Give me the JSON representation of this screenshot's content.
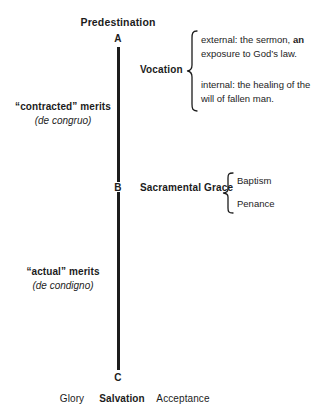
{
  "diagram": {
    "title": "Predestination",
    "background_color": "#ffffff",
    "ink_color": "#1c1c1c",
    "axis": {
      "name": "vertical-timeline",
      "upper_segment_label": "A to B",
      "lower_segment_label": "B to C"
    },
    "nodes": [
      {
        "id": "node-a",
        "letter": "A"
      },
      {
        "id": "node-b",
        "letter": "B"
      },
      {
        "id": "node-c",
        "letter": "C"
      }
    ],
    "left_annotations": [
      {
        "id": "contracted-merits",
        "line1": "“contracted” merits",
        "line2": "(de congruo)"
      },
      {
        "id": "actual-merits",
        "line1": "“actual” merits",
        "line2": "(de condigno)"
      }
    ],
    "branches": [
      {
        "id": "vocation",
        "label": "Vocation",
        "items": [
          {
            "id": "vocation-external",
            "prefix": "external: the sermon, ",
            "emphasis": "an",
            "suffix": " exposure to God’s law."
          },
          {
            "id": "vocation-internal",
            "prefix": "internal: the healing of the will of fallen man.",
            "emphasis": "",
            "suffix": ""
          }
        ]
      },
      {
        "id": "sacramental-grace",
        "label": "Sacramental Grace",
        "items": [
          {
            "id": "sacrament-baptism",
            "text": "Baptism"
          },
          {
            "id": "sacrament-penance",
            "text": "Penance"
          }
        ]
      }
    ],
    "footer": [
      {
        "id": "footer-glory",
        "text": "Glory",
        "emphasis": false
      },
      {
        "id": "footer-salvation",
        "text": "Salvation",
        "emphasis": true
      },
      {
        "id": "footer-acceptance",
        "text": "Acceptance",
        "emphasis": false
      }
    ]
  }
}
